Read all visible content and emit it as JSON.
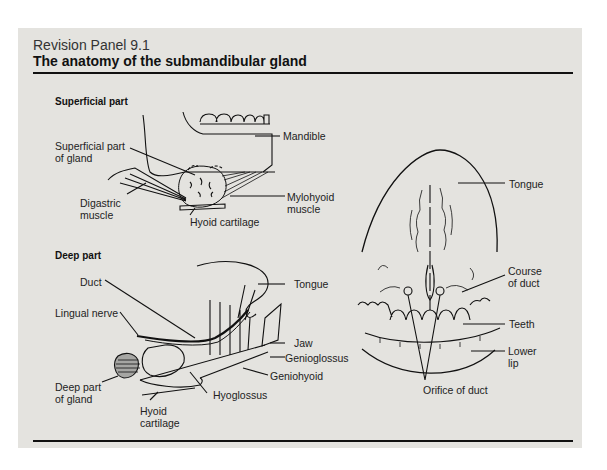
{
  "panel": {
    "kicker": "Revision Panel 9.1",
    "title": "The anatomy of the submandibular gland"
  },
  "superficial": {
    "heading": "Superficial part",
    "labels": {
      "superficial_part_of_gland": "Superficial part\nof gland",
      "mandible": "Mandible",
      "digastric_muscle": "Digastric\nmuscle",
      "mylohyoid_muscle": "Mylohyoid\nmuscle",
      "hyoid_cartilage": "Hyoid cartilage"
    }
  },
  "deep": {
    "heading": "Deep part",
    "labels": {
      "duct": "Duct",
      "tongue": "Tongue",
      "lingual_nerve": "Lingual nerve",
      "jaw": "Jaw",
      "genioglossus": "Genioglossus",
      "geniohyoid": "Geniohyoid",
      "deep_part_of_gland": "Deep part\nof gland",
      "hyoglossus": "Hyoglossus",
      "hyoid_cartilage": "Hyoid\ncartilage"
    }
  },
  "oral_view": {
    "labels": {
      "tongue": "Tongue",
      "course_of_duct": "Course\nof duct",
      "teeth": "Teeth",
      "lower_lip": "Lower\nlip",
      "orifice_of_duct": "Orifice of duct"
    }
  },
  "colors": {
    "panel_bg": "#e4e3df",
    "ink": "#111111"
  }
}
